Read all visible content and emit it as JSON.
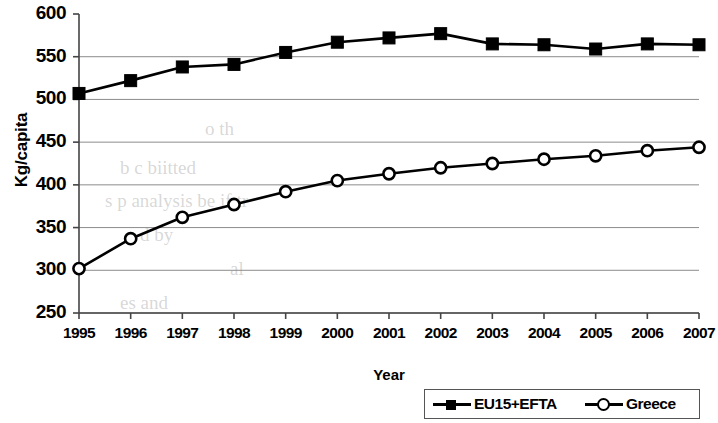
{
  "chart_data": {
    "type": "line",
    "title": "",
    "xlabel": "Year",
    "ylabel": "Kg/capita",
    "x": [
      1995,
      1996,
      1997,
      1998,
      1999,
      2000,
      2001,
      2002,
      2003,
      2004,
      2005,
      2006,
      2007
    ],
    "categories": [
      "1995",
      "1996",
      "1997",
      "1998",
      "1999",
      "2000",
      "2001",
      "2002",
      "2003",
      "2004",
      "2005",
      "2006",
      "2007"
    ],
    "xlim": [
      1995,
      2007
    ],
    "ylim": [
      250,
      600
    ],
    "yticks": [
      250,
      300,
      350,
      400,
      450,
      500,
      550,
      600
    ],
    "ytick_labels": [
      "250",
      "300",
      "350",
      "400",
      "450",
      "500",
      "550",
      "600"
    ],
    "grid": true,
    "grid_axis": "y",
    "legend_position": "bottom-right",
    "series": [
      {
        "name": "EU15+EFTA",
        "marker": "filled-square",
        "color": "#000000",
        "values": [
          507,
          522,
          538,
          541,
          555,
          567,
          572,
          577,
          565,
          564,
          559,
          565,
          564
        ]
      },
      {
        "name": "Greece",
        "marker": "open-circle",
        "color": "#000000",
        "values": [
          302,
          337,
          362,
          377,
          392,
          405,
          413,
          420,
          425,
          430,
          434,
          440,
          444
        ]
      }
    ]
  },
  "axes": {
    "y_title": "Kg/capita",
    "x_title": "Year"
  },
  "legend": {
    "items": [
      {
        "label": "EU15+EFTA"
      },
      {
        "label": "Greece"
      }
    ]
  },
  "background_bleed": [
    {
      "text": "o th",
      "x": 205,
      "y": 118
    },
    {
      "text": "b  c  biitted",
      "x": 120,
      "y": 157
    },
    {
      "text": "s  p analysis be  if tr",
      "x": 105,
      "y": 190
    },
    {
      "text": "d   by",
      "x": 140,
      "y": 224
    },
    {
      "text": "al",
      "x": 230,
      "y": 258
    },
    {
      "text": "es  and",
      "x": 120,
      "y": 292
    }
  ]
}
